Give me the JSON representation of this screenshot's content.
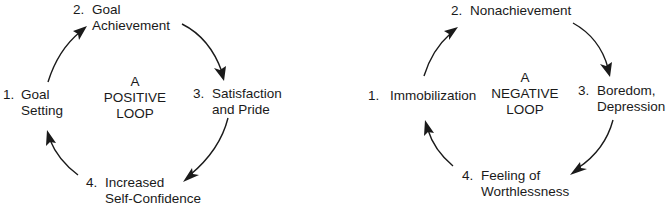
{
  "diagrams": [
    {
      "name": "positive-loop",
      "center": [
        "A",
        "POSITIVE",
        "LOOP"
      ],
      "steps": [
        {
          "num": "1.",
          "lines": [
            "Goal",
            "Setting"
          ]
        },
        {
          "num": "2.",
          "lines": [
            "Goal",
            "Achievement"
          ]
        },
        {
          "num": "3.",
          "lines": [
            "Satisfaction",
            "and Pride"
          ]
        },
        {
          "num": "4.",
          "lines": [
            "Increased",
            "Self-Confidence"
          ]
        }
      ]
    },
    {
      "name": "negative-loop",
      "center": [
        "A",
        "NEGATIVE",
        "LOOP"
      ],
      "steps": [
        {
          "num": "1.",
          "lines": [
            "Immobilization"
          ]
        },
        {
          "num": "2.",
          "lines": [
            "Nonachievement"
          ]
        },
        {
          "num": "3.",
          "lines": [
            "Boredom,",
            "Depression"
          ]
        },
        {
          "num": "4.",
          "lines": [
            "Feeling of",
            "Worthlessness"
          ]
        }
      ]
    }
  ],
  "colors": {
    "ink": "#1a1a1a",
    "background": "#ffffff"
  }
}
